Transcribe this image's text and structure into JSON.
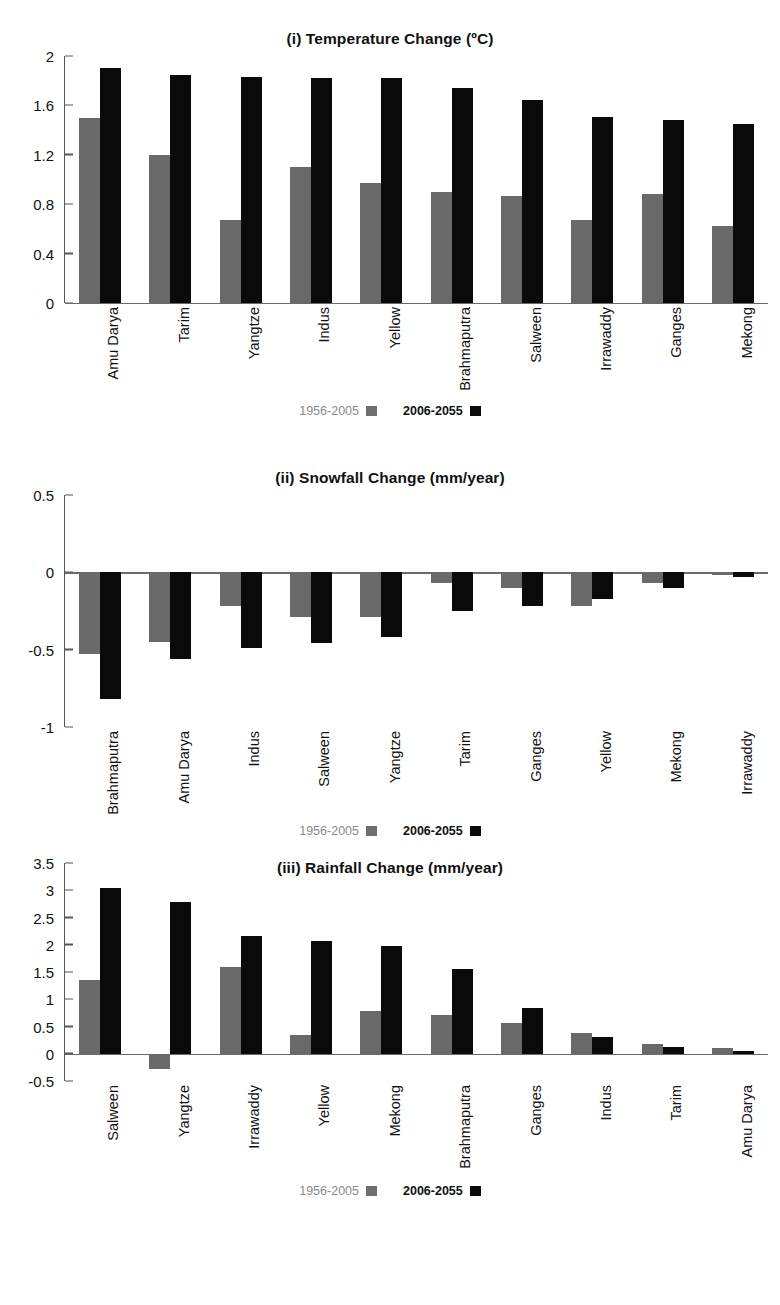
{
  "legend": {
    "historical_label": "1956-2005",
    "future_label": "2006-2055",
    "historical_color": "#696969",
    "future_color": "#0a0a0a"
  },
  "chart_data": [
    {
      "type": "bar",
      "panel": "(i)",
      "title": "(i) Temperature Change (ºC)",
      "xlabel": "",
      "ylabel": "",
      "ylim": [
        0,
        2
      ],
      "yticks": [
        0,
        0.4,
        0.8,
        1.2,
        1.6,
        2
      ],
      "ytick_labels": [
        "0",
        "0.4",
        "0.8",
        "1.2",
        "1.6",
        "2"
      ],
      "grid": false,
      "legend_position": "bottom-center",
      "categories": [
        "Amu Darya",
        "Tarim",
        "Yangtze",
        "Indus",
        "Yellow",
        "Brahmaputra",
        "Salween",
        "Irrawaddy",
        "Ganges",
        "Mekong"
      ],
      "series": [
        {
          "name": "1956-2005",
          "color": "#696969",
          "values": [
            1.5,
            1.2,
            0.67,
            1.1,
            0.97,
            0.9,
            0.87,
            0.67,
            0.88,
            0.62
          ]
        },
        {
          "name": "2006-2055",
          "color": "#0a0a0a",
          "values": [
            1.9,
            1.85,
            1.83,
            1.82,
            1.82,
            1.74,
            1.64,
            1.51,
            1.48,
            1.45
          ]
        }
      ]
    },
    {
      "type": "bar",
      "panel": "(ii)",
      "title": "(ii) Snowfall Change (mm/year)",
      "xlabel": "",
      "ylabel": "",
      "ylim": [
        -1,
        0.5
      ],
      "yticks": [
        0.5,
        0,
        -0.5,
        -1
      ],
      "ytick_labels": [
        "0.5",
        "0",
        "-0.5",
        "-1"
      ],
      "grid": false,
      "legend_position": "bottom-center",
      "categories": [
        "Brahmaputra",
        "Amu Darya",
        "Indus",
        "Salween",
        "Yangtze",
        "Tarim",
        "Ganges",
        "Yellow",
        "Mekong",
        "Irrawaddy"
      ],
      "series": [
        {
          "name": "1956-2005",
          "color": "#696969",
          "values": [
            -0.53,
            -0.45,
            -0.22,
            -0.29,
            -0.29,
            -0.07,
            -0.1,
            -0.22,
            -0.07,
            -0.02
          ]
        },
        {
          "name": "2006-2055",
          "color": "#0a0a0a",
          "values": [
            -0.82,
            -0.56,
            -0.49,
            -0.46,
            -0.42,
            -0.25,
            -0.22,
            -0.17,
            -0.1,
            -0.03
          ]
        }
      ]
    },
    {
      "type": "bar",
      "panel": "(iii)",
      "title": "(iii) Rainfall Change (mm/year)",
      "xlabel": "",
      "ylabel": "",
      "ylim": [
        -0.5,
        3.5
      ],
      "yticks": [
        3.5,
        3,
        2.5,
        2,
        1.5,
        1,
        0.5,
        0,
        -0.5
      ],
      "ytick_labels": [
        "3.5",
        "3",
        "2.5",
        "2",
        "1.5",
        "1",
        "0.5",
        "0",
        "-0.5"
      ],
      "grid": false,
      "legend_position": "bottom-center",
      "categories": [
        "Salween",
        "Yangtze",
        "Irrawaddy",
        "Yellow",
        "Mekong",
        "Brahmaputra",
        "Ganges",
        "Indus",
        "Tarim",
        "Amu Darya"
      ],
      "series": [
        {
          "name": "1956-2005",
          "color": "#696969",
          "values": [
            1.35,
            -0.28,
            1.59,
            0.35,
            0.78,
            0.71,
            0.56,
            0.38,
            0.17,
            0.11
          ]
        },
        {
          "name": "2006-2055",
          "color": "#0a0a0a",
          "values": [
            3.05,
            2.79,
            2.16,
            2.06,
            1.98,
            1.55,
            0.84,
            0.31,
            0.13,
            0.05
          ]
        }
      ]
    }
  ]
}
